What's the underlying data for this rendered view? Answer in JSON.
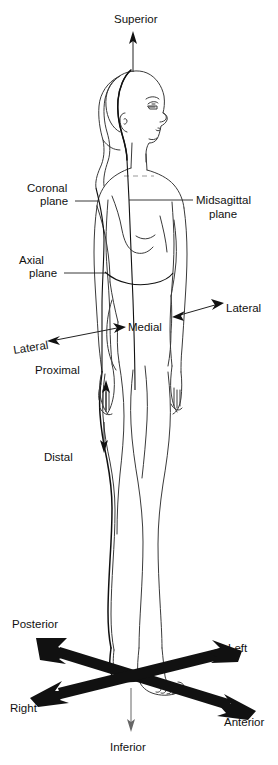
{
  "figure": {
    "background_color": "#ffffff",
    "line_color": "#3a3a3a",
    "label_color": "#111111",
    "bold_arrow_color": "#111111"
  },
  "labels": {
    "superior": "Superior",
    "inferior": "Inferior",
    "coronal_plane_line1": "Coronal",
    "coronal_plane_line2": "plane",
    "midsagittal_plane_line1": "Midsagittal",
    "midsagittal_plane_line2": "plane",
    "axial_plane_line1": "Axial",
    "axial_plane_line2": "plane",
    "lateral_left": "Lateral",
    "lateral_right": "Lateral",
    "medial": "Medial",
    "proximal": "Proximal",
    "distal": "Distal",
    "posterior": "Posterior",
    "anterior": "Anterior",
    "left": "Left",
    "right": "Right"
  },
  "annotations": [
    {
      "term": "Superior",
      "direction": "up",
      "arrow": "thin-single",
      "position": "top-center"
    },
    {
      "term": "Inferior",
      "direction": "down",
      "arrow": "thin-single",
      "position": "bottom-center"
    },
    {
      "term": "Coronal plane",
      "arrow": "leader-line",
      "position": "upper-left"
    },
    {
      "term": "Midsagittal plane",
      "arrow": "leader-line",
      "position": "upper-right"
    },
    {
      "term": "Axial plane",
      "arrow": "leader-line",
      "position": "mid-left"
    },
    {
      "term": "Lateral",
      "arrow": "thin-double",
      "position": "mid-left"
    },
    {
      "term": "Medial",
      "arrow": "none",
      "position": "mid-center"
    },
    {
      "term": "Lateral",
      "arrow": "thin-double",
      "position": "mid-right"
    },
    {
      "term": "Proximal",
      "arrow": "thin-single-up",
      "position": "forearm-upper"
    },
    {
      "term": "Distal",
      "arrow": "thin-single-down",
      "position": "forearm-lower"
    },
    {
      "term": "Posterior",
      "arrow": "bold-double",
      "position": "lower-left-upper"
    },
    {
      "term": "Left",
      "arrow": "bold-double",
      "position": "lower-right-upper"
    },
    {
      "term": "Right",
      "arrow": "bold-double",
      "position": "lower-left-lower"
    },
    {
      "term": "Anterior",
      "arrow": "bold-double",
      "position": "lower-right-lower"
    }
  ]
}
